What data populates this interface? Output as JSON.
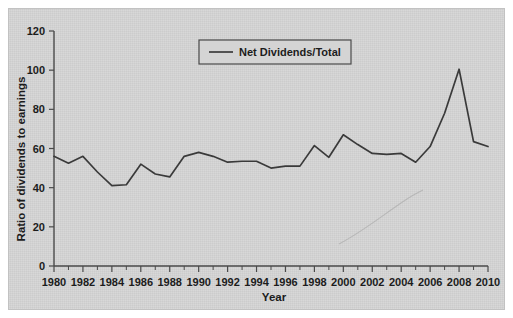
{
  "chart_data": {
    "type": "line",
    "title": "",
    "xlabel": "Year",
    "ylabel": "Ratio of dividends to earnings",
    "xlim": [
      1980,
      2010
    ],
    "ylim": [
      0,
      120
    ],
    "grid": false,
    "legend_position": "top-center",
    "y_ticks": [
      0,
      20,
      40,
      60,
      80,
      100,
      120
    ],
    "y_tick_labels": [
      "0",
      "20",
      "40",
      "60",
      "80",
      "100",
      "120"
    ],
    "x_ticks": [
      1980,
      1982,
      1984,
      1986,
      1988,
      1990,
      1992,
      1994,
      1996,
      1998,
      2000,
      2002,
      2004,
      2006,
      2008,
      2010
    ],
    "x_tick_labels": [
      "1980",
      "1982",
      "1984",
      "1986",
      "1988",
      "1990",
      "1992",
      "1994",
      "1996",
      "1998",
      "2000",
      "2002",
      "2004",
      "2006",
      "2008",
      "2010"
    ],
    "x_minor_tick_interval": 1,
    "x": [
      1980,
      1981,
      1982,
      1983,
      1984,
      1985,
      1986,
      1987,
      1988,
      1989,
      1990,
      1991,
      1992,
      1993,
      1994,
      1995,
      1996,
      1997,
      1998,
      1999,
      2000,
      2001,
      2002,
      2003,
      2004,
      2005,
      2006,
      2007,
      2008,
      2009,
      2010
    ],
    "series": [
      {
        "name": "Net Dividends/Total",
        "color": "#3a3a3a",
        "values": [
          56,
          52.5,
          56,
          48,
          41,
          41.5,
          52,
          47,
          45.5,
          56,
          58,
          56,
          53,
          53.5,
          53.5,
          50,
          51,
          51,
          61.5,
          55.5,
          67,
          62,
          57.5,
          57,
          57.5,
          53,
          61,
          78,
          100.5,
          63.5,
          61
        ]
      }
    ]
  },
  "legend": {
    "entries": [
      {
        "label": "Net Dividends/Total"
      }
    ]
  },
  "colors": {
    "panel_background": "#d4d4d4",
    "figure_background": "#ffffff",
    "line": "#3a3a3a",
    "axis": "#4a4a4a",
    "text": "#1c1c1c"
  }
}
